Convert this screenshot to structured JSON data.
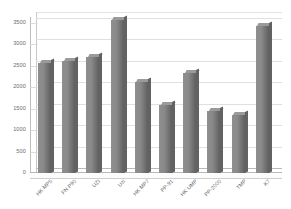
{
  "chart_data": {
    "type": "bar",
    "title": "",
    "subtitle": "",
    "xlabel": "",
    "ylabel": "",
    "categories": [
      "HK MP5",
      "FN P90",
      "UZI",
      "Uzi",
      "HK MP7",
      "PP-91",
      "HK UMP",
      "PP-2000",
      "TMP",
      "K7"
    ],
    "values": [
      2560,
      2620,
      2710,
      3570,
      2120,
      1590,
      2340,
      1440,
      1350,
      3440
    ],
    "series": [
      {
        "name": "",
        "values": [
          2560,
          2620,
          2710,
          3570,
          2120,
          1590,
          2340,
          1440,
          1350,
          3440
        ]
      }
    ],
    "ylim": [
      0,
      3500
    ],
    "ytick_labels": [
      "0",
      "500",
      "1000",
      "1500",
      "2000",
      "2500",
      "3000",
      "3500"
    ],
    "ytick_values": [
      0,
      500,
      1000,
      1500,
      2000,
      2500,
      3000,
      3500
    ],
    "grid": true,
    "legend": false,
    "legend_position": "none",
    "bar_color": "#7a7a7a",
    "bar_top_color": "#9a9a9a",
    "bar_side_color": "#626262",
    "grid_color": "#e0e0e0",
    "axis_color": "#bdbdbd",
    "tick_label_color": "#6d6d6d",
    "background_color": "#ffffff",
    "style": "3d-column"
  }
}
